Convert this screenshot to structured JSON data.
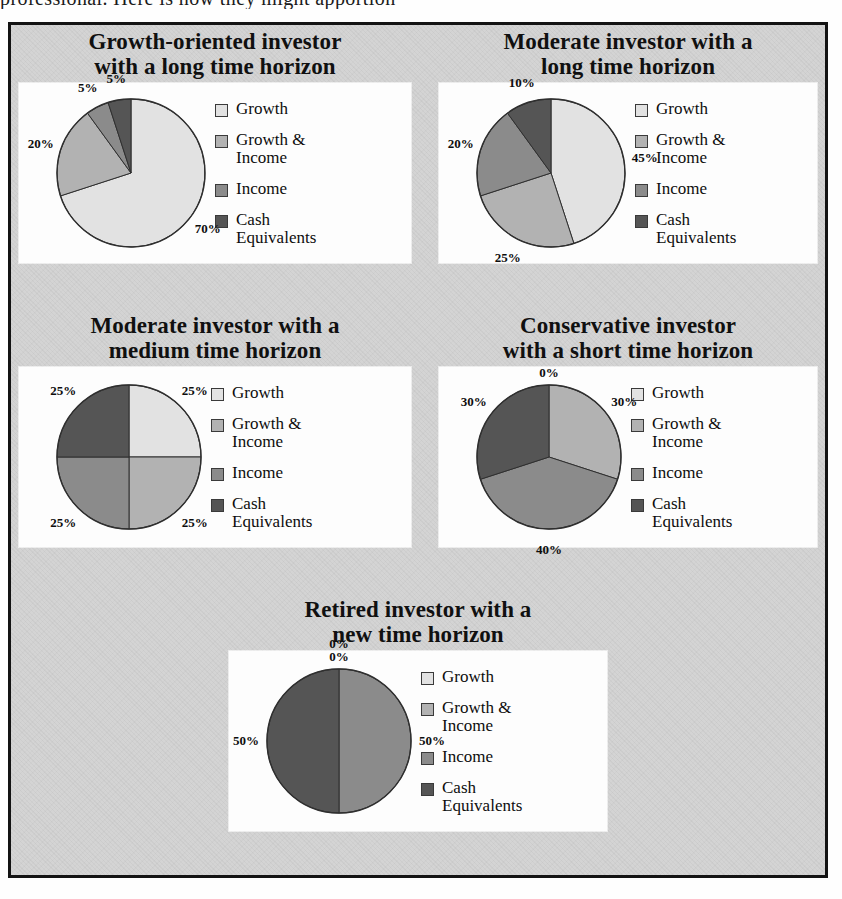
{
  "page": {
    "cutoff_text_above_figure": "professional. Here is how they might apportion"
  },
  "figure": {
    "background_color": "#d4d4d4",
    "border_color": "#131313",
    "card_color": "#fdfdfd"
  },
  "series_colors": {
    "growth": "#e2e2e2",
    "growth_income": "#b2b2b2",
    "income": "#8b8b8b",
    "cash_equivalents": "#555555"
  },
  "legend_labels": {
    "growth": "Growth",
    "growth_income": "Growth &\nIncome",
    "income": "Income",
    "cash_equivalents": "Cash\nEquivalents"
  },
  "chart_data": [
    {
      "type": "pie",
      "title": "Growth-oriented investor with a long time horizon",
      "title_lines": [
        "Growth-oriented investor",
        "with a long time horizon"
      ],
      "categories": [
        "Growth",
        "Growth & Income",
        "Income",
        "Cash Equivalents"
      ],
      "values": [
        70,
        20,
        5,
        5
      ],
      "labels": [
        "70%",
        "20%",
        "5%",
        "5%"
      ],
      "units": "percent",
      "legend_position": "right",
      "start_angle_deg": 0,
      "direction": "clockwise"
    },
    {
      "type": "pie",
      "title": "Moderate investor with a long time horizon",
      "title_lines": [
        "Moderate investor with a",
        "long time horizon"
      ],
      "categories": [
        "Growth",
        "Growth & Income",
        "Income",
        "Cash Equivalents"
      ],
      "values": [
        45,
        25,
        20,
        10
      ],
      "labels": [
        "45%",
        "25%",
        "20%",
        "10%"
      ],
      "units": "percent",
      "legend_position": "right",
      "start_angle_deg": 0,
      "direction": "clockwise"
    },
    {
      "type": "pie",
      "title": "Moderate investor with a medium time horizon",
      "title_lines": [
        "Moderate investor with a",
        "medium time horizon"
      ],
      "categories": [
        "Growth",
        "Growth & Income",
        "Income",
        "Cash Equivalents"
      ],
      "values": [
        25,
        25,
        25,
        25
      ],
      "labels": [
        "25%",
        "25%",
        "25%",
        "25%"
      ],
      "units": "percent",
      "legend_position": "right",
      "start_angle_deg": 0,
      "direction": "clockwise"
    },
    {
      "type": "pie",
      "title": "Conservative investor with a short time horizon",
      "title_lines": [
        "Conservative investor",
        "with a short time horizon"
      ],
      "categories": [
        "Growth",
        "Growth & Income",
        "Income",
        "Cash Equivalents"
      ],
      "values": [
        0,
        30,
        40,
        30
      ],
      "labels": [
        "0%",
        "30%",
        "40%",
        "30%"
      ],
      "units": "percent",
      "legend_position": "right",
      "start_angle_deg": 0,
      "direction": "clockwise"
    },
    {
      "type": "pie",
      "title": "Retired investor with a new time horizon",
      "title_lines": [
        "Retired investor with a",
        "new time horizon"
      ],
      "categories": [
        "Growth",
        "Growth & Income",
        "Income",
        "Cash Equivalents"
      ],
      "values": [
        0,
        0,
        50,
        50
      ],
      "labels": [
        "0%",
        "0%",
        "50%",
        "50%"
      ],
      "units": "percent",
      "legend_position": "right",
      "start_angle_deg": 0,
      "direction": "clockwise"
    }
  ]
}
